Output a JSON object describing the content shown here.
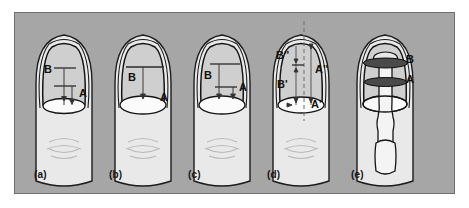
{
  "figure": {
    "background_color": "#a6a6a6",
    "border_color": "#6f6f6f",
    "page_background": "#ffffff",
    "nail_plate_color": "#cfcfcf",
    "skin_color": "#e9e9e9",
    "lunula_color": "#fbfbfb",
    "label_color": "#111111"
  },
  "panels": [
    {
      "id": "a",
      "label": "(a)",
      "measurements": [
        {
          "name": "B",
          "text": "B"
        },
        {
          "name": "A",
          "text": "A"
        }
      ]
    },
    {
      "id": "b",
      "label": "(b)",
      "measurements": [
        {
          "name": "B",
          "text": "B"
        },
        {
          "name": "A",
          "text": "A"
        }
      ]
    },
    {
      "id": "c",
      "label": "(c)",
      "measurements": [
        {
          "name": "B",
          "text": "B"
        },
        {
          "name": "A",
          "text": "A"
        }
      ]
    },
    {
      "id": "d",
      "label": "(d)",
      "measurements": [
        {
          "name": "B-double-prime",
          "text": "B''"
        },
        {
          "name": "B-prime",
          "text": "B'"
        },
        {
          "name": "A-double-prime",
          "text": "A''"
        },
        {
          "name": "A-prime",
          "text": "A'"
        }
      ]
    },
    {
      "id": "e",
      "label": "(e)",
      "measurements": [
        {
          "name": "B",
          "text": "B"
        },
        {
          "name": "A",
          "text": "A"
        }
      ]
    }
  ]
}
